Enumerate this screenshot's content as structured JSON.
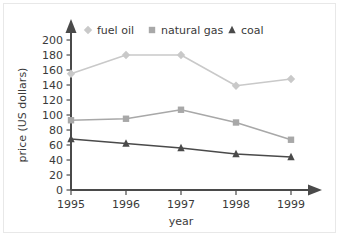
{
  "chart_data": {
    "type": "line",
    "title": "",
    "xlabel": "year",
    "ylabel": "price (US dollars)",
    "categories": [
      "1995",
      "1996",
      "1997",
      "1998",
      "1999"
    ],
    "x": [
      1995,
      1996,
      1997,
      1998,
      1999
    ],
    "xlim": [
      1995,
      1999
    ],
    "ylim": [
      0,
      200
    ],
    "yticks": [
      0,
      20,
      40,
      60,
      80,
      100,
      120,
      140,
      160,
      180,
      200
    ],
    "ytick_labels": [
      "0",
      "20",
      "40",
      "60",
      "80",
      "100",
      "120",
      "140",
      "160",
      "180",
      "200"
    ],
    "grid": false,
    "legend_position": "top",
    "series": [
      {
        "name": "fuel oil",
        "marker": "diamond",
        "color": "#c9c9c9",
        "values": [
          155,
          180,
          180,
          139,
          148
        ]
      },
      {
        "name": "natural gas",
        "marker": "square",
        "color": "#a8a8a8",
        "values": [
          93,
          95,
          107,
          90,
          67
        ]
      },
      {
        "name": "coal",
        "marker": "triangle",
        "color": "#4a4a4a",
        "values": [
          68,
          62,
          56,
          48,
          44
        ]
      }
    ]
  },
  "axes": {
    "axis_color": "#4a4a4a",
    "tick_color": "#4a4a4a",
    "y_axis_title": "price (US dollars)",
    "x_axis_title": "year"
  },
  "legend": {
    "entries": [
      {
        "label": "fuel oil",
        "marker": "diamond-marker-icon",
        "color": "#c9c9c9"
      },
      {
        "label": "natural gas",
        "marker": "square-marker-icon",
        "color": "#a8a8a8"
      },
      {
        "label": "coal",
        "marker": "triangle-marker-icon",
        "color": "#4a4a4a"
      }
    ]
  },
  "icons": {
    "y_axis_arrow": "arrow-up-icon",
    "x_axis_arrow": "arrow-right-icon"
  }
}
